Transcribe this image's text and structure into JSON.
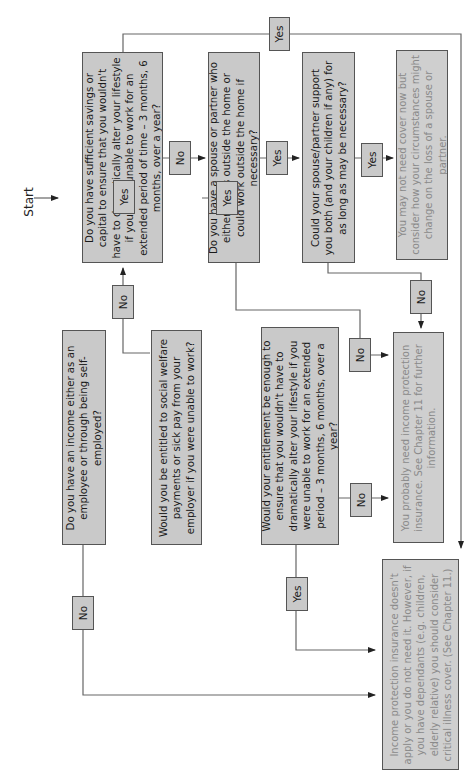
{
  "start_label": "Start",
  "questions": {
    "q1": {
      "text": "Do you have an income either as an employee or through being self-employed?"
    },
    "q2": {
      "text": "Would you be entitled to social welfare payments or sick pay from your employer if you were unable to work?"
    },
    "q3": {
      "text": "Would your entitlement be enough to ensure that you wouldn't have to dramatically alter your lifestyle if you were unable to work for an extended period – 3 months, 6 months, over a year?"
    },
    "q4": {
      "text": "Do you have sufficient savings or capital to ensure that you wouldn't have to dramatically alter your lifestyle if you were unable to work for an extended period of time – 3 months, 6 months, over a year?"
    },
    "q5": {
      "text": "Do you have a spouse or partner who either works outside the home or could work outside the home if necessary?"
    },
    "q6": {
      "text": "Could your spouse/partner support you both (and your children if any) for as long as may be necessary?"
    }
  },
  "results": {
    "r1": {
      "text": "You may not need cover now but consider how your circumstances might change on the loss of a spouse or partner."
    },
    "r2": {
      "text": "You probably need income protection insurance. See Chapter 11 for further information."
    },
    "r3": {
      "text": "Income protection insurance doesn't apply or you do not need it. However, if you have dependants (e.g. children, elderly relative) you should consider critical illness cover. (See Chapter 11.)"
    }
  },
  "edges": {
    "q1_yes": "Yes",
    "q1_no": "No",
    "q2_yes": "Yes",
    "q2_no": "No",
    "q3_yes": "Yes",
    "q3_no": "No",
    "q4_yes": "Yes",
    "q4_no": "No",
    "q5_yes": "Yes",
    "q5_no": "No",
    "q6_yes": "Yes",
    "q6_no": "No"
  },
  "colors": {
    "box_fill": "#c9c9c9",
    "border": "#555555",
    "result_text": "#8a8a8a",
    "question_text": "#1a1a1a"
  }
}
